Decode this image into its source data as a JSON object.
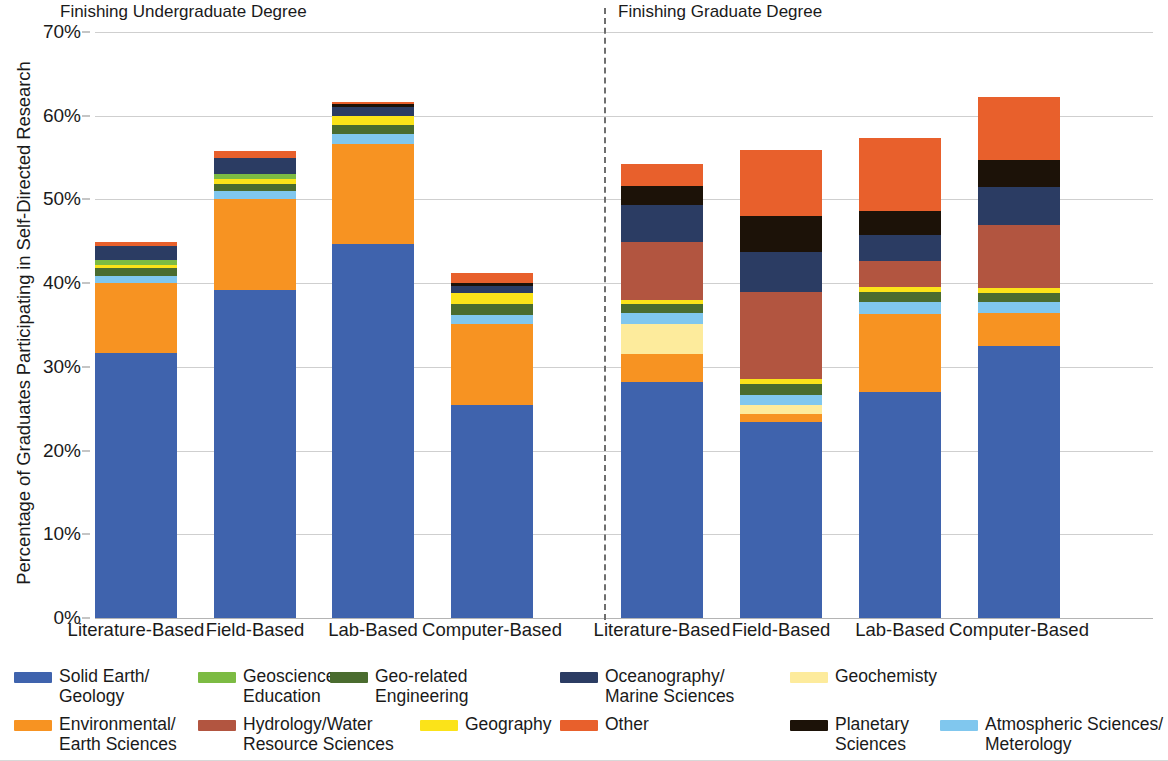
{
  "chart_data": {
    "type": "bar",
    "subtype": "stacked-bar",
    "title": "",
    "xlabel": "",
    "ylabel": "Percentage of Graduates Participating in Self-Directed Research",
    "ylim": [
      0,
      70
    ],
    "ytick_labels": [
      "0%",
      "10%",
      "20%",
      "30%",
      "40%",
      "50%",
      "60%",
      "70%"
    ],
    "ytick_values": [
      0,
      10,
      20,
      30,
      40,
      50,
      60,
      70
    ],
    "grid": true,
    "legend_position": "bottom",
    "panels": [
      {
        "label": "Finishing Undergraduate Degree",
        "categories": [
          "Literature-Based",
          "Field-Based",
          "Lab-Based",
          "Computer-Based"
        ]
      },
      {
        "label": "Finishing Graduate Degree",
        "categories": [
          "Literature-Based",
          "Field-Based",
          "Lab-Based",
          "Computer-Based"
        ]
      }
    ],
    "categories": [
      "Literature-Based",
      "Field-Based",
      "Lab-Based",
      "Computer-Based",
      "Literature-Based",
      "Field-Based",
      "Lab-Based",
      "Computer-Based"
    ],
    "series": [
      {
        "name": "Solid Earth/\nGeology",
        "color": "#3f63ad",
        "values": [
          31.6,
          39.2,
          44.7,
          25.4,
          28.2,
          23.4,
          27.0,
          32.5
        ]
      },
      {
        "name": "Environmental/\nEarth Sciences",
        "color": "#f79322",
        "values": [
          8.4,
          10.9,
          11.9,
          9.7,
          3.3,
          1.0,
          9.3,
          3.9
        ]
      },
      {
        "name": "Geochemisty",
        "color": "#fdeb9c",
        "values": [
          0.0,
          0.0,
          0.0,
          0.0,
          3.6,
          1.0,
          0.0,
          0.0
        ]
      },
      {
        "name": "Atmospheric Sciences/\nMeterology",
        "color": "#80c7ee",
        "values": [
          0.8,
          0.9,
          1.2,
          1.1,
          1.3,
          1.3,
          1.4,
          1.3
        ]
      },
      {
        "name": "Geo-related\nEngineering",
        "color": "#4a6c2f",
        "values": [
          1.0,
          0.9,
          1.1,
          1.3,
          1.1,
          1.2,
          1.2,
          1.1
        ]
      },
      {
        "name": "Geography",
        "color": "#fbe319",
        "values": [
          0.4,
          0.5,
          1.1,
          1.3,
          0.5,
          0.6,
          0.6,
          0.6
        ]
      },
      {
        "name": "Geoscience\nEducation",
        "color": "#7cbb43",
        "values": [
          0.6,
          0.7,
          0.0,
          0.0,
          0.0,
          0.0,
          0.0,
          0.0
        ]
      },
      {
        "name": "Hydrology/Water\nResource Sciences",
        "color": "#b25540",
        "values": [
          0.0,
          0.0,
          0.0,
          0.0,
          6.9,
          10.5,
          3.2,
          7.5
        ]
      },
      {
        "name": "Oceanography/\nMarine Sciences",
        "color": "#2b3c63",
        "values": [
          1.6,
          1.9,
          1.1,
          0.9,
          4.5,
          4.7,
          3.1,
          4.6
        ]
      },
      {
        "name": "Planetary\nSciences",
        "color": "#1c1208",
        "values": [
          0.0,
          0.0,
          0.3,
          0.3,
          2.2,
          4.3,
          2.8,
          3.2
        ]
      },
      {
        "name": "Other",
        "color": "#e8602c",
        "values": [
          0.5,
          0.8,
          0.2,
          1.2,
          2.7,
          7.9,
          8.8,
          7.6
        ]
      }
    ],
    "legend_entries": [
      {
        "label": "Solid Earth/\nGeology",
        "color": "#3f63ad"
      },
      {
        "label": "Geoscience\nEducation",
        "color": "#7cbb43"
      },
      {
        "label": "Geo-related\nEngineering",
        "color": "#4a6c2f"
      },
      {
        "label": "Oceanography/\nMarine Sciences",
        "color": "#2b3c63"
      },
      {
        "label": "Geochemisty",
        "color": "#fdeb9c"
      },
      {
        "label": "Environmental/\nEarth Sciences",
        "color": "#f79322"
      },
      {
        "label": "Hydrology/Water\nResource Sciences",
        "color": "#b25540"
      },
      {
        "label": "Geography",
        "color": "#fbe319"
      },
      {
        "label": "Other",
        "color": "#e8602c"
      },
      {
        "label": "Planetary\nSciences",
        "color": "#1c1208"
      },
      {
        "label": "Atmospheric Sciences/\nMeterology",
        "color": "#80c7ee"
      }
    ]
  }
}
